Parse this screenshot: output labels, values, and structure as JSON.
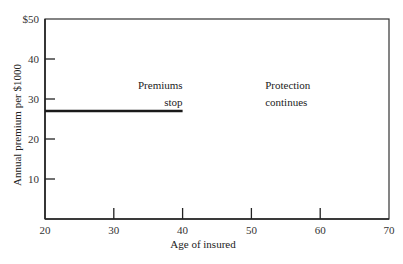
{
  "chart_data": {
    "type": "line",
    "title": "",
    "xlabel": "Age of insured",
    "ylabel": "Annual premium per $1000",
    "xlim": [
      20,
      70
    ],
    "ylim": [
      0,
      50
    ],
    "x_ticks": [
      20,
      30,
      40,
      50,
      60,
      70
    ],
    "x_tick_labels": [
      "20",
      "30",
      "40",
      "50",
      "60",
      "70"
    ],
    "y_ticks": [
      10,
      20,
      30,
      40,
      50
    ],
    "y_tick_labels": [
      "10",
      "20",
      "30",
      "40",
      "$50"
    ],
    "grid": false,
    "series": [
      {
        "name": "Annual premium",
        "x": [
          20,
          40
        ],
        "y": [
          27,
          27
        ]
      }
    ],
    "annotations": [
      {
        "text_lines": [
          "Premiums",
          "stop"
        ],
        "x": 40,
        "y": 31,
        "align": "right"
      },
      {
        "text_lines": [
          "Protection",
          "continues"
        ],
        "x": 52,
        "y": 31,
        "align": "left"
      }
    ]
  }
}
